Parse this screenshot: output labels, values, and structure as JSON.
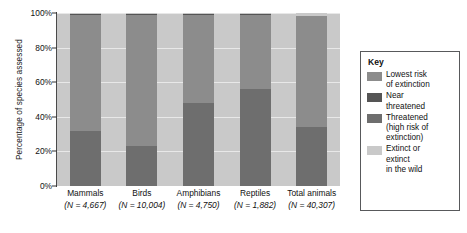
{
  "chart_data": {
    "type": "bar",
    "subtype": "stacked-bar-100",
    "title": "",
    "xlabel": "",
    "ylabel": "Percentage of species assessed",
    "ylim": [
      0,
      100
    ],
    "yticks": [
      "0%",
      "20%",
      "40%",
      "60%",
      "80%",
      "100%"
    ],
    "ytick_values": [
      0,
      20,
      40,
      60,
      80,
      100
    ],
    "grid": true,
    "legend_position": "right",
    "categories": [
      "Mammals",
      "Birds",
      "Amphibians",
      "Reptiles",
      "Total animals"
    ],
    "category_n": [
      "(N = 4,667)",
      "(N = 10,004)",
      "(N = 4,750)",
      "(N = 1,882)",
      "(N = 40,307)"
    ],
    "series": [
      {
        "name": "Threatened (high risk of extinction)",
        "color": "#6e6e6e",
        "values": [
          32,
          23,
          48,
          56,
          34
        ]
      },
      {
        "name": "Lowest risk of extinction",
        "color": "#8c8c8c",
        "values": [
          67,
          76,
          51,
          43,
          64
        ]
      },
      {
        "name": "Near threatened",
        "color": "#555555",
        "values": [
          0.5,
          0.5,
          0.5,
          0.5,
          0.5
        ]
      },
      {
        "name": "Extinct or extinct in the wild",
        "color": "#c9c9c9",
        "values": [
          0.5,
          0.5,
          0.5,
          0.5,
          1.5
        ]
      }
    ]
  },
  "legend": {
    "title": "Key",
    "items": [
      {
        "color": "#8c8c8c",
        "lines": [
          "Lowest risk",
          "of extinction"
        ]
      },
      {
        "color": "#555555",
        "lines": [
          "Near",
          "threatened"
        ]
      },
      {
        "color": "#6e6e6e",
        "lines": [
          "Threatened",
          "(high risk of",
          "extinction)"
        ]
      },
      {
        "color": "#c9c9c9",
        "lines": [
          "Extinct or",
          "extinct",
          "in the wild"
        ]
      }
    ]
  }
}
